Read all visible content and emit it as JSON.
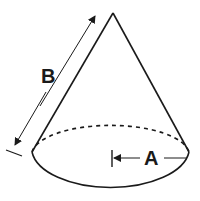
{
  "diagram": {
    "shape": "cone",
    "labels": {
      "slant_height": "B",
      "radius": "A"
    },
    "colors": {
      "stroke": "#1a1a1a",
      "background": "#ffffff"
    }
  }
}
